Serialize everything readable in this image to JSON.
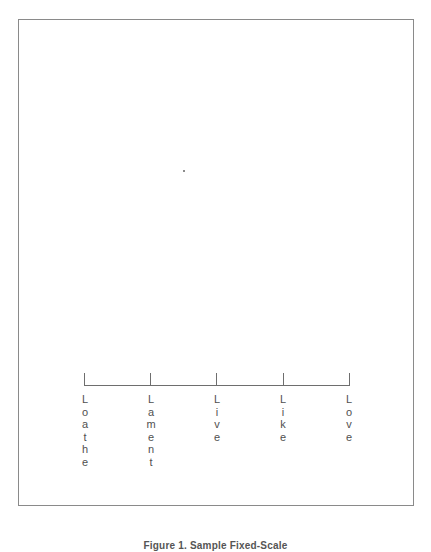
{
  "figure": {
    "caption": "Figure 1. Sample Fixed-Scale"
  },
  "scale": {
    "points": [
      {
        "label": "Loathe",
        "x": 84
      },
      {
        "label": "Lament",
        "x": 150
      },
      {
        "label": "Live",
        "x": 216
      },
      {
        "label": "Like",
        "x": 283
      },
      {
        "label": "Love",
        "x": 349
      }
    ]
  },
  "colors": {
    "frame": "#8a8a8a",
    "axis": "#6e6e6e",
    "text": "#505050"
  }
}
